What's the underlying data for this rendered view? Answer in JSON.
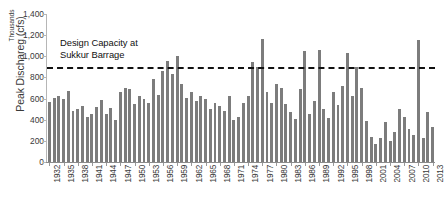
{
  "chart_data": {
    "type": "bar",
    "title": "",
    "xlabel": "",
    "ylabel": "Peak Dischareg (cfs)",
    "unit_label": "Thousands",
    "ylim": [
      0,
      1400
    ],
    "ytick_values": [
      0,
      200,
      400,
      600,
      800,
      1000,
      1200,
      1400
    ],
    "ytick_labels": [
      "0",
      "200",
      "400",
      "600",
      "800",
      "1,000",
      "1,200",
      "1,400"
    ],
    "grid": false,
    "legend_position": "none",
    "bar_color": "#7c7c7c",
    "xtick_step": 3,
    "xtick_labels": [
      "1932",
      "1935",
      "1938",
      "1941",
      "1944",
      "1947",
      "1950",
      "1953",
      "1956",
      "1959",
      "1962",
      "1965",
      "1968",
      "1971",
      "1974",
      "1977",
      "1980",
      "1983",
      "1986",
      "1989",
      "1992",
      "1995",
      "1998",
      "2001",
      "2004",
      "2007",
      "2010",
      "2013"
    ],
    "annotation": {
      "text": "Design Capacity at\nSukkur Barrage",
      "line_value": 900,
      "line_style": "dashed",
      "line_color": "#111111"
    },
    "categories": [
      "1932",
      "1933",
      "1934",
      "1935",
      "1936",
      "1937",
      "1938",
      "1939",
      "1940",
      "1941",
      "1942",
      "1943",
      "1944",
      "1945",
      "1946",
      "1947",
      "1948",
      "1949",
      "1950",
      "1951",
      "1952",
      "1953",
      "1954",
      "1955",
      "1956",
      "1957",
      "1958",
      "1959",
      "1960",
      "1961",
      "1962",
      "1963",
      "1964",
      "1965",
      "1966",
      "1967",
      "1968",
      "1969",
      "1970",
      "1971",
      "1972",
      "1973",
      "1974",
      "1975",
      "1976",
      "1977",
      "1978",
      "1979",
      "1980",
      "1981",
      "1982",
      "1983",
      "1984",
      "1985",
      "1986",
      "1987",
      "1988",
      "1989",
      "1990",
      "1991",
      "1992",
      "1993",
      "1994",
      "1995",
      "1996",
      "1997",
      "1998",
      "1999",
      "2000",
      "2001",
      "2002",
      "2003",
      "2004",
      "2005",
      "2006",
      "2007",
      "2008",
      "2009",
      "2010",
      "2011",
      "2012",
      "2013"
    ],
    "values": [
      570,
      610,
      620,
      600,
      670,
      480,
      500,
      530,
      430,
      455,
      520,
      590,
      450,
      510,
      400,
      660,
      700,
      690,
      545,
      625,
      600,
      560,
      790,
      630,
      860,
      960,
      830,
      1000,
      740,
      610,
      660,
      580,
      620,
      600,
      500,
      560,
      530,
      480,
      620,
      400,
      430,
      560,
      620,
      950,
      900,
      1165,
      660,
      560,
      740,
      700,
      550,
      470,
      410,
      690,
      1050,
      450,
      580,
      1060,
      500,
      420,
      660,
      540,
      720,
      1030,
      620,
      900,
      700,
      390,
      240,
      175,
      225,
      380,
      195,
      280,
      500,
      430,
      310,
      255,
      1150,
      230,
      470,
      330
    ]
  }
}
